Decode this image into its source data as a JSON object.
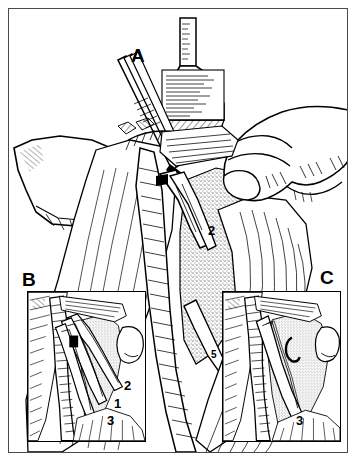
{
  "figure": {
    "type": "surgical-technique-illustration",
    "style": "black-and-white pen-and-ink hatching line drawing",
    "border_color": "#4a4a4a",
    "ink_color": "#000000",
    "background_color": "#ffffff",
    "panels": [
      {
        "id": "A",
        "label": "A",
        "role": "main-overview",
        "label_position": {
          "x": 131,
          "y": 46
        },
        "callouts": [
          {
            "number": "2",
            "x": 208,
            "y": 224
          },
          {
            "number": "5",
            "x": 211,
            "y": 350
          }
        ],
        "elements": [
          {
            "name": "irrigation-bottle",
            "description": "Upright labeled bottle with graduated neck at top center"
          },
          {
            "name": "dissecting-forceps",
            "description": "Long slender forceps entering from upper left"
          },
          {
            "name": "surgical-retractor",
            "description": "Double-pronged retractor held in the field"
          },
          {
            "name": "surgeons-hand",
            "description": "Gloved hand with extended fingers entering from the right"
          },
          {
            "name": "surgical-drape",
            "description": "Draped cloth fold at the left margin"
          },
          {
            "name": "anatomical-vessel",
            "description": "Large tubular structure running vertically through the field"
          },
          {
            "name": "stippled-tissue",
            "description": "Stippled soft-tissue mass at center right"
          }
        ]
      },
      {
        "id": "B",
        "label": "B",
        "role": "inset-detail-left",
        "label_position": {
          "x": 22,
          "y": 270
        },
        "inset_box": {
          "x": 27,
          "y": 291,
          "width": 119,
          "height": 151
        },
        "callouts": [
          {
            "number": "2",
            "x": 124,
            "y": 379
          },
          {
            "number": "1",
            "x": 114,
            "y": 397
          },
          {
            "number": "3",
            "x": 107,
            "y": 414
          }
        ],
        "elements": [
          {
            "name": "retractor-blades",
            "description": "Pair of angled instrument blades held open in the wound"
          },
          {
            "name": "ridged-vessel",
            "description": "Banded tubular vessel descending on the left"
          },
          {
            "name": "stippled-tissue",
            "description": "Stippled tissue plane at right of the blades"
          },
          {
            "name": "rounded-structure",
            "description": "Smooth rounded anatomical lobe at the right edge"
          }
        ]
      },
      {
        "id": "C",
        "label": "C",
        "role": "inset-detail-right",
        "label_position": {
          "x": 320,
          "y": 268
        },
        "inset_box": {
          "x": 222,
          "y": 291,
          "width": 119,
          "height": 151
        },
        "callouts": [
          {
            "number": "3",
            "x": 296,
            "y": 414
          }
        ],
        "elements": [
          {
            "name": "single-retractor-blade",
            "description": "Single angled instrument blade in the wound"
          },
          {
            "name": "ridged-vessel",
            "description": "Banded tubular vessel descending on the left"
          },
          {
            "name": "sutured-tissue",
            "description": "Stippled tissue with two small dark suture marks at center"
          },
          {
            "name": "rounded-structure",
            "description": "Smooth rounded anatomical lobe at the right edge"
          }
        ]
      }
    ],
    "legend_numbers": [
      "1",
      "2",
      "3",
      "5"
    ],
    "bottle": {
      "name": "irrigation-bottle",
      "label_text": "",
      "label_appearance": "hatched illegible printed label"
    }
  }
}
